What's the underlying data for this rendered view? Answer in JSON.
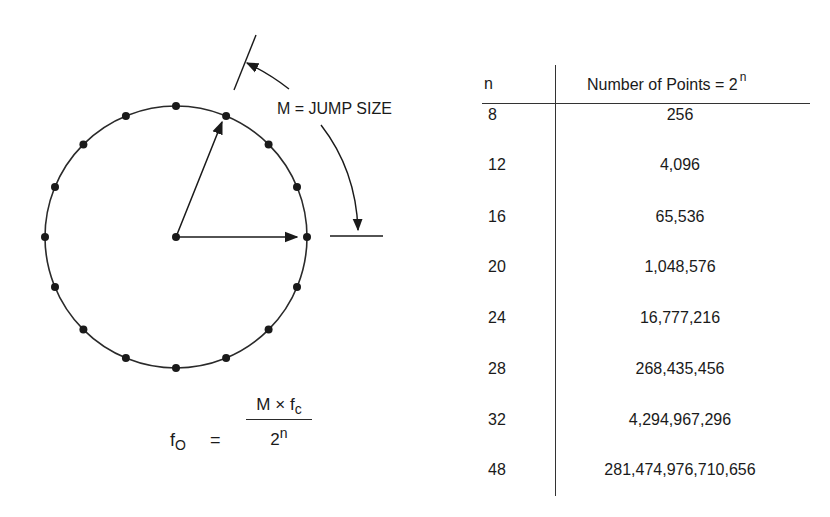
{
  "diagram": {
    "jump_label": "M = JUMP SIZE",
    "points_on_circle": 16,
    "circle": {
      "cx": 176,
      "cy": 237,
      "r": 131
    },
    "colors": {
      "ink": "#1a1a1a",
      "background": "#ffffff"
    }
  },
  "formula": {
    "lhs": "f",
    "lhs_sub": "O",
    "equals": "=",
    "numerator": "M × f",
    "numerator_sub": "c",
    "denominator": "2",
    "denominator_sup": "n"
  },
  "table": {
    "header": {
      "n": "n",
      "points": "Number of Points = 2",
      "points_sup": "n"
    },
    "rows": [
      {
        "n": "8",
        "points": "256"
      },
      {
        "n": "12",
        "points": "4,096"
      },
      {
        "n": "16",
        "points": "65,536"
      },
      {
        "n": "20",
        "points": "1,048,576"
      },
      {
        "n": "24",
        "points": "16,777,216"
      },
      {
        "n": "28",
        "points": "268,435,456"
      },
      {
        "n": "32",
        "points": "4,294,967,296"
      },
      {
        "n": "48",
        "points": "281,474,976,710,656"
      }
    ]
  }
}
